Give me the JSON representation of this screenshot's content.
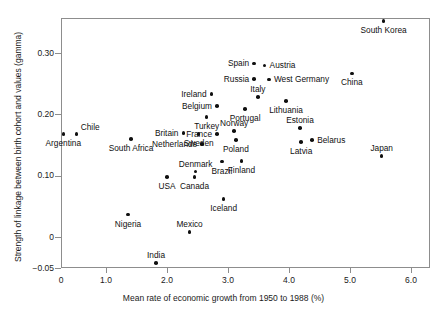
{
  "chart_data": {
    "type": "scatter",
    "title": "",
    "xlabel": "Mean rate of economic growth from 1950 to 1988 (%)",
    "ylabel": "Strength of linkage between birth cohort and values (gamma)",
    "xlim": [
      0,
      6.2
    ],
    "ylim": [
      -0.05,
      0.365
    ],
    "xticks": [
      "0",
      "1.0",
      "2.0",
      "3.0",
      "4.0",
      "5.0",
      "6.0"
    ],
    "xtick_values": [
      0,
      1.0,
      2.0,
      3.0,
      4.0,
      5.0,
      6.0
    ],
    "yticks": [
      "0.30",
      "0.20",
      "0.10",
      "0",
      "-0.05"
    ],
    "ytick_values": [
      0.3,
      0.2,
      0.1,
      0,
      -0.05
    ],
    "grid": false,
    "legend": "none",
    "marker": "filled-circle",
    "points": [
      {
        "label": "Argentina",
        "x": 0.3,
        "y": 0.168,
        "pos": "below"
      },
      {
        "label": "Chile",
        "x": 0.52,
        "y": 0.168,
        "pos": "above-right"
      },
      {
        "label": "South Africa",
        "x": 1.41,
        "y": 0.16,
        "pos": "below"
      },
      {
        "label": "Nigeria",
        "x": 1.36,
        "y": 0.037,
        "pos": "below"
      },
      {
        "label": "India",
        "x": 1.82,
        "y": -0.042,
        "pos": "above"
      },
      {
        "label": "USA",
        "x": 2.0,
        "y": 0.098,
        "pos": "below"
      },
      {
        "label": "Britain",
        "x": 2.27,
        "y": 0.17,
        "pos": "left"
      },
      {
        "label": "Netherlands",
        "x": 2.57,
        "y": 0.152,
        "pos": "left"
      },
      {
        "label": "Mexico",
        "x": 2.37,
        "y": 0.009,
        "pos": "above"
      },
      {
        "label": "Canada",
        "x": 2.45,
        "y": 0.098,
        "pos": "below"
      },
      {
        "label": "Denmark",
        "x": 2.47,
        "y": 0.107,
        "pos": "above"
      },
      {
        "label": "Sweden",
        "x": 2.52,
        "y": 0.168,
        "pos": "below"
      },
      {
        "label": "Turkey",
        "x": 2.65,
        "y": 0.196,
        "pos": "below"
      },
      {
        "label": "Ireland",
        "x": 2.73,
        "y": 0.233,
        "pos": "left"
      },
      {
        "label": "Belgium",
        "x": 2.82,
        "y": 0.214,
        "pos": "left"
      },
      {
        "label": "France",
        "x": 2.82,
        "y": 0.168,
        "pos": "left"
      },
      {
        "label": "Brazil",
        "x": 2.9,
        "y": 0.123,
        "pos": "below"
      },
      {
        "label": "Iceland",
        "x": 2.93,
        "y": 0.062,
        "pos": "below"
      },
      {
        "label": "Poland",
        "x": 3.13,
        "y": 0.158,
        "pos": "below"
      },
      {
        "label": "Finland",
        "x": 3.22,
        "y": 0.124,
        "pos": "below"
      },
      {
        "label": "Norway",
        "x": 3.1,
        "y": 0.173,
        "pos": "above"
      },
      {
        "label": "Portugal",
        "x": 3.28,
        "y": 0.209,
        "pos": "below"
      },
      {
        "label": "Italy",
        "x": 3.49,
        "y": 0.228,
        "pos": "above"
      },
      {
        "label": "Spain",
        "x": 3.43,
        "y": 0.283,
        "pos": "left"
      },
      {
        "label": "Russia",
        "x": 3.43,
        "y": 0.258,
        "pos": "left"
      },
      {
        "label": "Austria",
        "x": 3.6,
        "y": 0.28,
        "pos": "right"
      },
      {
        "label": "West Germany",
        "x": 3.67,
        "y": 0.257,
        "pos": "right"
      },
      {
        "label": "Lithuania",
        "x": 3.95,
        "y": 0.222,
        "pos": "below"
      },
      {
        "label": "Estonia",
        "x": 4.18,
        "y": 0.178,
        "pos": "above"
      },
      {
        "label": "Latvia",
        "x": 4.2,
        "y": 0.155,
        "pos": "below"
      },
      {
        "label": "Belarus",
        "x": 4.38,
        "y": 0.158,
        "pos": "right"
      },
      {
        "label": "China",
        "x": 5.03,
        "y": 0.267,
        "pos": "below"
      },
      {
        "label": "South Korea",
        "x": 5.55,
        "y": 0.352,
        "pos": "below"
      },
      {
        "label": "Japan",
        "x": 5.52,
        "y": 0.132,
        "pos": "above"
      }
    ]
  }
}
